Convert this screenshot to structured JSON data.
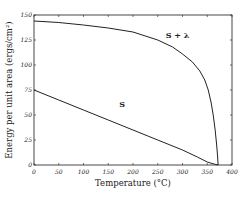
{
  "chart_data": {
    "type": "line",
    "title": "",
    "xlabel": "Temperature (°C)",
    "ylabel": "Energy per unit area (ergs/cm²)",
    "xlim": [
      0,
      400
    ],
    "ylim": [
      0,
      150
    ],
    "grid": false,
    "legend": "none (curves labeled directly)",
    "x_ticks": [
      0,
      50,
      100,
      150,
      200,
      250,
      300,
      350,
      400
    ],
    "y_ticks": [
      0,
      25,
      50,
      75,
      100,
      125,
      150
    ],
    "series": [
      {
        "name": "S + λ",
        "label": "S + λ",
        "label_position": {
          "x": 290,
          "y": 127
        },
        "points": [
          [
            0,
            144
          ],
          [
            50,
            142.5
          ],
          [
            100,
            140
          ],
          [
            150,
            137
          ],
          [
            200,
            133
          ],
          [
            250,
            125
          ],
          [
            280,
            118
          ],
          [
            300,
            111
          ],
          [
            320,
            103
          ],
          [
            335,
            94
          ],
          [
            345,
            85
          ],
          [
            352,
            75
          ],
          [
            358,
            62
          ],
          [
            362,
            50
          ],
          [
            366,
            35
          ],
          [
            369,
            20
          ],
          [
            371,
            8
          ],
          [
            372,
            0
          ]
        ]
      },
      {
        "name": "S",
        "label": "S",
        "label_position": {
          "x": 178,
          "y": 58
        },
        "points": [
          [
            0,
            75
          ],
          [
            50,
            65
          ],
          [
            100,
            55
          ],
          [
            150,
            45
          ],
          [
            200,
            35
          ],
          [
            250,
            25
          ],
          [
            300,
            15
          ],
          [
            330,
            8
          ],
          [
            350,
            3
          ],
          [
            365,
            0.8
          ],
          [
            372,
            0
          ]
        ]
      }
    ]
  }
}
